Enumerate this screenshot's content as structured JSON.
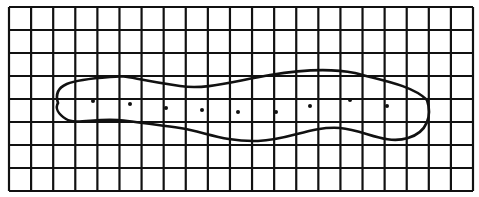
{
  "figure": {
    "type": "grid-with-outline",
    "background": "#ffffff",
    "ink": "#111111",
    "grid": {
      "left": 9,
      "top": 7,
      "right": 473,
      "bottom": 191,
      "columns": 21,
      "rows": 8,
      "line_width": 2.2
    },
    "outline": {
      "description": "closed elongated blob shape spanning grid horizontally",
      "path": "M 58 103 C 52 84, 70 80, 110 77 C 130 75, 125 78, 180 86 C 205 90, 230 82, 270 75 C 300 70, 330 68, 355 73 C 380 80, 412 85, 427 100 C 432 115, 428 132, 408 138 C 385 145, 365 130, 340 128 C 310 126, 290 140, 258 141 C 225 142, 205 132, 180 128 C 150 124, 130 121, 118 120 C 95 118, 75 125, 66 119 C 58 114, 55 108, 58 103 Z",
      "stroke_width": 2.6
    },
    "dots": [
      {
        "x": 93,
        "y": 101
      },
      {
        "x": 130,
        "y": 104
      },
      {
        "x": 166,
        "y": 108
      },
      {
        "x": 202,
        "y": 110
      },
      {
        "x": 238,
        "y": 112
      },
      {
        "x": 276,
        "y": 112
      },
      {
        "x": 310,
        "y": 106
      },
      {
        "x": 350,
        "y": 100
      },
      {
        "x": 387,
        "y": 106
      }
    ],
    "dot_radius": 2
  }
}
